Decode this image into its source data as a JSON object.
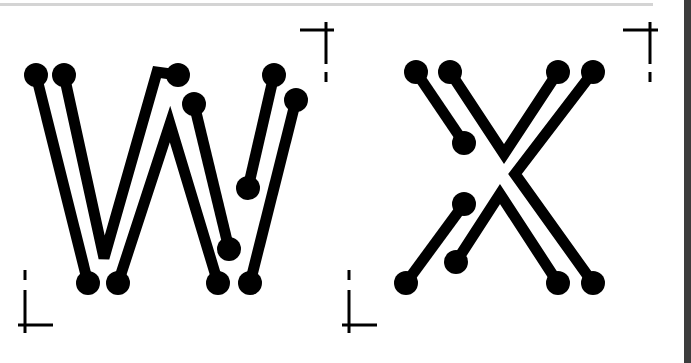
{
  "artwork": {
    "letters": [
      "W",
      "X"
    ],
    "stroke_color": "#000000",
    "background": "#ffffff",
    "trace_width": 11,
    "pad_radius": 12
  },
  "colors": {
    "top_rule": "#d4d4d4",
    "right_edge": "#3c3c3c"
  },
  "crop_marks": [
    {
      "name": "crop-mark-top-right-w",
      "h": [
        300,
        30,
        334,
        30
      ],
      "v": [
        326,
        22,
        326,
        64
      ],
      "dash": [
        326,
        72,
        326,
        82
      ]
    },
    {
      "name": "crop-mark-top-right-x",
      "h": [
        623,
        30,
        658,
        30
      ],
      "v": [
        650,
        22,
        650,
        64
      ],
      "dash": [
        650,
        72,
        650,
        82
      ]
    },
    {
      "name": "crop-mark-bottom-left-w",
      "h": [
        18,
        325,
        53,
        325
      ],
      "v": [
        25,
        290,
        25,
        333
      ],
      "dash": [
        25,
        270,
        25,
        280
      ]
    },
    {
      "name": "crop-mark-bottom-left-x",
      "h": [
        342,
        325,
        377,
        325
      ],
      "v": [
        349,
        290,
        349,
        333
      ],
      "dash": [
        349,
        270,
        349,
        280
      ]
    }
  ],
  "traces": [
    {
      "name": "w-trace-1",
      "points": "36,75 88,283"
    },
    {
      "name": "w-trace-2",
      "points": "64,75 104,258 157,72 178,75"
    },
    {
      "name": "w-trace-3",
      "points": "118,283 170,124 218,283"
    },
    {
      "name": "w-trace-4",
      "points": "194,104 229,249"
    },
    {
      "name": "w-trace-5",
      "points": "274,75 248,188"
    },
    {
      "name": "w-trace-6",
      "points": "296,100 250,283"
    },
    {
      "name": "x-trace-1",
      "points": "416,72 464,143"
    },
    {
      "name": "x-trace-2",
      "points": "450,72 504,154 558,72"
    },
    {
      "name": "x-trace-3",
      "points": "593,72 515,174 593,283"
    },
    {
      "name": "x-trace-4",
      "points": "464,204 406,283"
    },
    {
      "name": "x-trace-5",
      "points": "456,262 500,194 558,283"
    }
  ],
  "pads": [
    {
      "name": "w-pad-top-1",
      "cx": 36,
      "cy": 75
    },
    {
      "name": "w-pad-top-2",
      "cx": 64,
      "cy": 75
    },
    {
      "name": "w-pad-top-3",
      "cx": 178,
      "cy": 75
    },
    {
      "name": "w-pad-top-4",
      "cx": 194,
      "cy": 104
    },
    {
      "name": "w-pad-top-5",
      "cx": 274,
      "cy": 75
    },
    {
      "name": "w-pad-top-6",
      "cx": 296,
      "cy": 100
    },
    {
      "name": "w-pad-mid-1",
      "cx": 248,
      "cy": 188
    },
    {
      "name": "w-pad-mid-2",
      "cx": 229,
      "cy": 249
    },
    {
      "name": "w-pad-bottom-1",
      "cx": 88,
      "cy": 283
    },
    {
      "name": "w-pad-bottom-2",
      "cx": 118,
      "cy": 283
    },
    {
      "name": "w-pad-bottom-3",
      "cx": 218,
      "cy": 283
    },
    {
      "name": "w-pad-bottom-4",
      "cx": 250,
      "cy": 283
    },
    {
      "name": "x-pad-top-1",
      "cx": 416,
      "cy": 72
    },
    {
      "name": "x-pad-top-2",
      "cx": 450,
      "cy": 72
    },
    {
      "name": "x-pad-top-3",
      "cx": 558,
      "cy": 72
    },
    {
      "name": "x-pad-top-4",
      "cx": 593,
      "cy": 72
    },
    {
      "name": "x-pad-mid-1",
      "cx": 464,
      "cy": 143
    },
    {
      "name": "x-pad-mid-2",
      "cx": 464,
      "cy": 204
    },
    {
      "name": "x-pad-mid-3",
      "cx": 456,
      "cy": 262
    },
    {
      "name": "x-pad-bottom-1",
      "cx": 406,
      "cy": 283
    },
    {
      "name": "x-pad-bottom-2",
      "cx": 558,
      "cy": 283
    },
    {
      "name": "x-pad-bottom-3",
      "cx": 593,
      "cy": 283
    }
  ]
}
